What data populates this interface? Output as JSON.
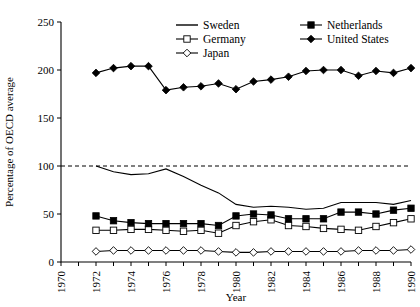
{
  "chart_data": {
    "type": "line",
    "title": "",
    "xlabel": "Year",
    "ylabel": "Percentage of OECD average",
    "xlim": [
      1970,
      1990
    ],
    "ylim": [
      0,
      250
    ],
    "yticks": [
      0,
      50,
      100,
      150,
      200,
      250
    ],
    "xticks": [
      1970,
      1971,
      1972,
      1973,
      1974,
      1975,
      1976,
      1977,
      1978,
      1979,
      1980,
      1981,
      1982,
      1983,
      1984,
      1985,
      1986,
      1987,
      1988,
      1989,
      1990
    ],
    "xtick_labels": [
      "1970",
      "1972",
      "1974",
      "1976",
      "1978",
      "1980",
      "1982",
      "1984",
      "1986",
      "1988",
      "1990"
    ],
    "xtick_label_values": [
      1970,
      1972,
      1974,
      1976,
      1978,
      1980,
      1982,
      1984,
      1986,
      1988,
      1990
    ],
    "grid": false,
    "legend_position": "top-right",
    "reference_line": {
      "value": 100,
      "style": "dashed"
    },
    "x": [
      1972,
      1973,
      1974,
      1975,
      1976,
      1977,
      1978,
      1979,
      1980,
      1981,
      1982,
      1983,
      1984,
      1985,
      1986,
      1987,
      1988,
      1989,
      1990
    ],
    "series": [
      {
        "name": "Sweden",
        "marker": "none",
        "marker_style": "line",
        "values": [
          100,
          94,
          91,
          92,
          97,
          89,
          80,
          72,
          60,
          57,
          58,
          57,
          55,
          56,
          62,
          62,
          62,
          60,
          64
        ]
      },
      {
        "name": "Germany",
        "marker": "open-square",
        "marker_style": "open-square",
        "values": [
          33,
          33,
          34,
          34,
          33,
          32,
          33,
          30,
          38,
          42,
          44,
          38,
          37,
          35,
          34,
          33,
          37,
          41,
          45
        ]
      },
      {
        "name": "Japan",
        "marker": "open-diamond",
        "marker_style": "open-diamond",
        "values": [
          11,
          12,
          12,
          12,
          12,
          12,
          12,
          11,
          10,
          10,
          11,
          11,
          11,
          11,
          11,
          12,
          12,
          12,
          13
        ]
      },
      {
        "name": "Netherlands",
        "marker": "filled-square",
        "marker_style": "filled-square",
        "values": [
          48,
          43,
          41,
          40,
          40,
          40,
          40,
          38,
          48,
          50,
          49,
          45,
          45,
          45,
          52,
          52,
          50,
          54,
          56
        ]
      },
      {
        "name": "United States",
        "marker": "filled-diamond",
        "marker_style": "filled-diamond",
        "values": [
          197,
          202,
          204,
          204,
          179,
          182,
          183,
          186,
          180,
          188,
          190,
          193,
          199,
          200,
          200,
          194,
          199,
          197,
          202
        ]
      }
    ],
    "legend": [
      {
        "label": "Sweden",
        "marker": "line"
      },
      {
        "label": "Germany",
        "marker": "open-square"
      },
      {
        "label": "Japan",
        "marker": "open-diamond"
      },
      {
        "label": "Netherlands",
        "marker": "filled-square"
      },
      {
        "label": "United States",
        "marker": "filled-diamond"
      }
    ],
    "colors": {
      "ink": "#000000",
      "background": "#ffffff"
    }
  }
}
